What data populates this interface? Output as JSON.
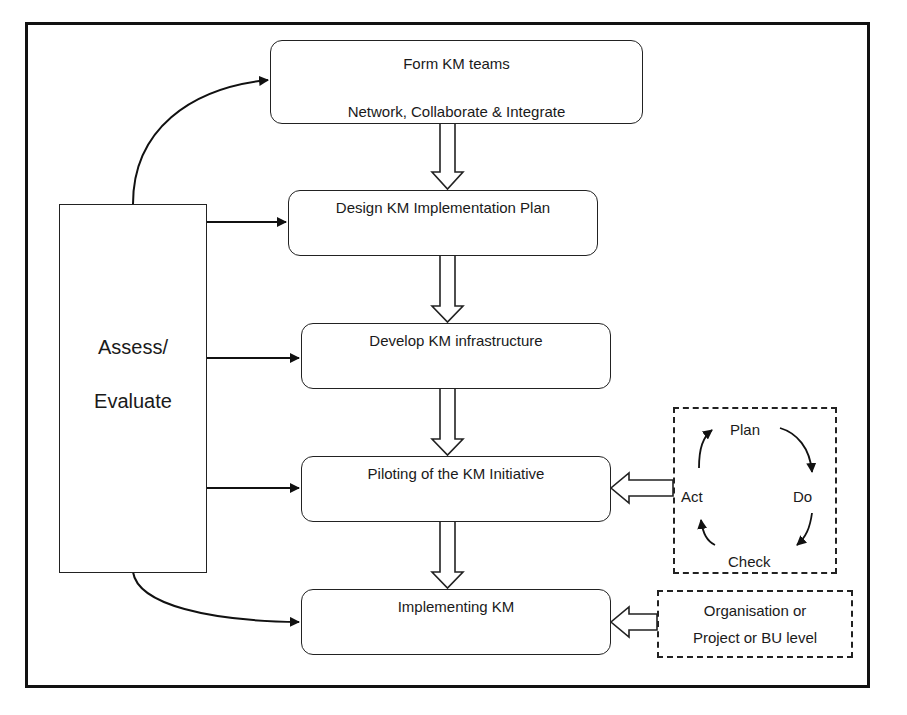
{
  "diagram": {
    "steps": [
      {
        "title": "Form KM teams",
        "subtitle": "Network, Collaborate & Integrate"
      },
      {
        "title": "Design KM Implementation Plan"
      },
      {
        "title": "Develop KM infrastructure"
      },
      {
        "title": "Piloting of the KM Initiative"
      },
      {
        "title": "Implementing KM"
      }
    ],
    "assess": {
      "line1": "Assess/",
      "line2": "Evaluate"
    },
    "pdca": {
      "plan": "Plan",
      "do": "Do",
      "check": "Check",
      "act": "Act"
    },
    "scope": {
      "line1": "Organisation or",
      "line2": "Project or BU level"
    },
    "colors": {
      "stroke": "#222222",
      "frame": "#111111",
      "background": "#ffffff"
    }
  }
}
